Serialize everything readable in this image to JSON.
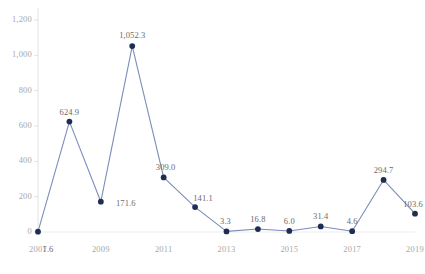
{
  "chart_data": {
    "type": "line",
    "title": "",
    "subtitle": "",
    "xlabel": "",
    "ylabel": "",
    "x": [
      2007,
      2008,
      2009,
      2010,
      2011,
      2012,
      2013,
      2014,
      2015,
      2016,
      2017,
      2018,
      2019
    ],
    "values": [
      1.6,
      624.9,
      171.6,
      1052.3,
      309.0,
      141.1,
      3.3,
      16.8,
      6.0,
      31.4,
      4.6,
      294.7,
      103.6
    ],
    "point_labels": [
      "1.6",
      "624.9",
      "171.6",
      "1,052.3",
      "309.0",
      "141.1",
      "3.3",
      "16.8",
      "6.0",
      "31.4",
      "4.6",
      "294.7",
      "103.6"
    ],
    "series": [
      {
        "name": "",
        "values": [
          1.6,
          624.9,
          171.6,
          1052.3,
          309.0,
          141.1,
          3.3,
          16.8,
          6.0,
          31.4,
          4.6,
          294.7,
          103.6
        ]
      }
    ],
    "ylim": [
      0,
      1200
    ],
    "xlim": [
      2007,
      2019
    ],
    "yticks": [
      0,
      200,
      400,
      600,
      800,
      1000,
      1200
    ],
    "ytick_labels": [
      "0",
      "200",
      "400",
      "600",
      "800",
      "1,000",
      "1,200"
    ],
    "xticks": [
      2007,
      2009,
      2011,
      2013,
      2015,
      2017,
      2019
    ],
    "xtick_labels": [
      "2007",
      "2009",
      "2011",
      "2013",
      "2015",
      "2017",
      "2019"
    ],
    "grid": false,
    "legend": "none",
    "line_color": "#7b8db8",
    "marker_color": "#1f2d52",
    "axis_color": "#e3e3e3",
    "tick_text_color": "#a8a8a8",
    "label_text_color": "#6b6b6b"
  }
}
